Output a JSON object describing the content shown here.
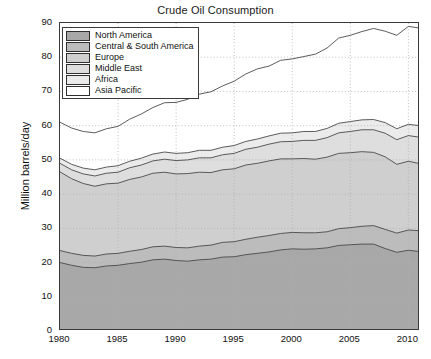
{
  "chart_data": {
    "type": "area",
    "stacked": true,
    "title": "Crude Oil Consumption",
    "xlabel": "",
    "ylabel": "Million barrels/day",
    "xlim": [
      1980,
      2011
    ],
    "ylim": [
      0,
      90
    ],
    "ytick_labels": [
      "0",
      "10",
      "20",
      "30",
      "40",
      "50",
      "60",
      "70",
      "80",
      "90"
    ],
    "yticks": [
      0,
      10,
      20,
      30,
      40,
      50,
      60,
      70,
      80,
      90
    ],
    "xtick_labels": [
      "1980",
      "1985",
      "1990",
      "1995",
      "2000",
      "2005",
      "2010"
    ],
    "xticks": [
      1980,
      1985,
      1990,
      1995,
      2000,
      2005,
      2010
    ],
    "grid": true,
    "grid_style": "dotted",
    "legend_position": "upper left",
    "x": [
      1980,
      1981,
      1982,
      1983,
      1984,
      1985,
      1986,
      1987,
      1988,
      1989,
      1990,
      1991,
      1992,
      1993,
      1994,
      1995,
      1996,
      1997,
      1998,
      1999,
      2000,
      2001,
      2002,
      2003,
      2004,
      2005,
      2006,
      2007,
      2008,
      2009,
      2010,
      2011
    ],
    "series": [
      {
        "name": "North America",
        "color": "#a8a8a8",
        "values": [
          20.0,
          19.2,
          18.6,
          18.5,
          19.0,
          19.2,
          19.7,
          20.1,
          20.8,
          21.0,
          20.6,
          20.4,
          20.8,
          21.0,
          21.6,
          21.7,
          22.3,
          22.7,
          23.1,
          23.7,
          24.0,
          23.9,
          24.0,
          24.3,
          25.0,
          25.2,
          25.4,
          25.4,
          24.1,
          23.0,
          23.6,
          23.2
        ]
      },
      {
        "name": "Central & South America",
        "color": "#bcbcbc",
        "values": [
          3.5,
          3.5,
          3.5,
          3.4,
          3.5,
          3.5,
          3.6,
          3.7,
          3.8,
          3.8,
          3.8,
          3.9,
          4.0,
          4.1,
          4.3,
          4.4,
          4.5,
          4.7,
          4.8,
          4.8,
          4.8,
          4.8,
          4.7,
          4.7,
          4.9,
          5.0,
          5.2,
          5.4,
          5.6,
          5.6,
          5.9,
          6.1
        ]
      },
      {
        "name": "Europe",
        "color": "#cfcfcf",
        "values": [
          23.0,
          21.8,
          21.0,
          20.4,
          20.5,
          20.5,
          21.0,
          21.2,
          21.5,
          21.6,
          21.5,
          21.7,
          21.6,
          21.2,
          21.2,
          21.3,
          21.7,
          21.6,
          21.8,
          21.8,
          21.5,
          21.7,
          21.5,
          21.8,
          22.0,
          21.9,
          21.8,
          21.4,
          21.2,
          20.1,
          20.1,
          19.6
        ]
      },
      {
        "name": "Middle East",
        "color": "#dedede",
        "values": [
          2.5,
          2.6,
          2.8,
          3.0,
          3.1,
          3.2,
          3.4,
          3.5,
          3.6,
          3.8,
          3.9,
          4.0,
          4.2,
          4.3,
          4.4,
          4.5,
          4.6,
          4.7,
          4.9,
          5.0,
          5.1,
          5.3,
          5.5,
          5.7,
          6.0,
          6.2,
          6.4,
          6.6,
          6.9,
          7.2,
          7.5,
          7.7
        ]
      },
      {
        "name": "Africa",
        "color": "#ebebeb",
        "values": [
          1.5,
          1.6,
          1.7,
          1.8,
          1.8,
          1.9,
          1.9,
          2.0,
          2.0,
          2.1,
          2.1,
          2.1,
          2.2,
          2.2,
          2.2,
          2.3,
          2.3,
          2.4,
          2.4,
          2.5,
          2.5,
          2.6,
          2.6,
          2.7,
          2.8,
          2.9,
          2.9,
          3.0,
          3.1,
          3.2,
          3.3,
          3.4
        ]
      },
      {
        "name": "Asia Pacific",
        "color": "#ffffff",
        "values": [
          10.5,
          10.6,
          10.7,
          10.8,
          11.2,
          11.5,
          12.3,
          12.9,
          13.6,
          14.4,
          14.9,
          15.6,
          16.4,
          17.1,
          17.9,
          18.8,
          19.7,
          20.5,
          20.4,
          21.3,
          21.6,
          21.9,
          22.6,
          23.5,
          24.9,
          25.2,
          25.8,
          26.6,
          26.7,
          27.3,
          28.6,
          28.5
        ]
      }
    ],
    "totals": [
      61.0,
      59.3,
      58.3,
      57.9,
      59.1,
      59.8,
      61.9,
      63.4,
      65.3,
      66.7,
      66.8,
      67.7,
      69.2,
      69.9,
      71.6,
      73.0,
      75.1,
      76.6,
      77.4,
      79.1,
      79.5,
      80.2,
      80.9,
      82.7,
      85.6,
      86.4,
      87.5,
      88.4,
      87.6,
      86.4,
      89.0,
      88.5
    ]
  },
  "legend": {
    "items": [
      {
        "label": "North America",
        "swatch": "#a8a8a8"
      },
      {
        "label": "Central & South America",
        "swatch": "#bcbcbc"
      },
      {
        "label": "Europe",
        "swatch": "#cfcfcf"
      },
      {
        "label": "Middle East",
        "swatch": "#dedede"
      },
      {
        "label": "Africa",
        "swatch": "#ebebeb"
      },
      {
        "label": "Asia Pacific",
        "swatch": "#ffffff"
      }
    ]
  },
  "axis": {
    "line_color": "#3a3a3a",
    "grid_color": "#b0b0b0",
    "series_line_color": "#4a4a4a"
  }
}
